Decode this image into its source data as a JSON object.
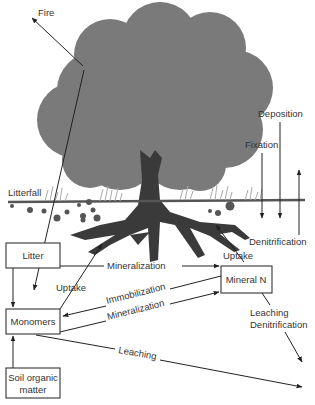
{
  "diagram": {
    "type": "nitrogen-cycle",
    "labels": {
      "fire": "Fire",
      "deposition": "Deposition",
      "fixation": "Fixation",
      "denitrification_top": "Denitrification",
      "litterfall": "Litterfall",
      "uptake_right": "Uptake",
      "uptake_left": "Uptake",
      "mineralization_top": "Mineralization",
      "immobilization": "Immobilization",
      "mineralization_bottom": "Mineralization",
      "leaching_denitrification_1": "Leaching",
      "leaching_denitrification_2": "Denitrification",
      "leaching": "Leaching"
    },
    "boxes": {
      "litter": "Litter",
      "mineral_n": "Mineral N",
      "monomers": "Monomers",
      "soil_organic_1": "Soil organic",
      "soil_organic_2": "matter"
    },
    "colors": {
      "canopy": "#7a7a7a",
      "trunk": "#3a3a3a",
      "ground": "#555555",
      "grass": "#aaaaaa",
      "line": "#222222"
    }
  }
}
